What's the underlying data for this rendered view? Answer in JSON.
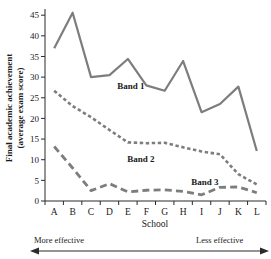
{
  "chart_data": {
    "type": "line",
    "title": "",
    "xlabel": "School",
    "ylabel": "Final academic achievement (average exam score)",
    "ylabel_line1": "Final academic achievement",
    "ylabel_line2": "(average exam score)",
    "categories": [
      "A",
      "B",
      "C",
      "D",
      "E",
      "F",
      "G",
      "H",
      "I",
      "J",
      "K",
      "L"
    ],
    "yticks": [
      0,
      5,
      10,
      15,
      20,
      25,
      30,
      35,
      40,
      45
    ],
    "ylim": [
      0,
      46.5
    ],
    "grid": false,
    "legend_position": "inline-labels",
    "line_color": "#7d7d7d",
    "axis_color": "#2b2b2b",
    "series": [
      {
        "name": "Band 1",
        "style": "solid",
        "values": [
          37.0,
          45.6,
          30.0,
          30.5,
          34.4,
          28.0,
          26.7,
          33.9,
          21.5,
          23.5,
          27.7,
          12.1
        ]
      },
      {
        "name": "Band 2",
        "style": "dotted",
        "values": [
          26.7,
          23.0,
          20.3,
          17.2,
          14.2,
          14.0,
          14.1,
          13.0,
          12.0,
          11.3,
          6.5,
          4.0
        ]
      },
      {
        "name": "Band 3",
        "style": "dashed",
        "values": [
          13.2,
          8.0,
          2.5,
          4.2,
          2.2,
          2.6,
          2.7,
          2.3,
          1.5,
          3.3,
          3.4,
          2.0
        ]
      }
    ],
    "annotations": [
      {
        "name": "more-effective",
        "text": "More effective"
      },
      {
        "name": "less-effective",
        "text": "Less effective"
      }
    ]
  }
}
